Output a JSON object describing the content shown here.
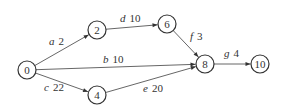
{
  "diagram": {
    "type": "directed-network",
    "nodes": [
      {
        "id": "0",
        "label": "0",
        "x": 27,
        "y": 70
      },
      {
        "id": "2",
        "label": "2",
        "x": 97,
        "y": 30
      },
      {
        "id": "4",
        "label": "4",
        "x": 97,
        "y": 95
      },
      {
        "id": "6",
        "label": "6",
        "x": 167,
        "y": 24
      },
      {
        "id": "8",
        "label": "8",
        "x": 205,
        "y": 64
      },
      {
        "id": "10",
        "label": "10",
        "x": 260,
        "y": 64
      }
    ],
    "edges": [
      {
        "name": "a",
        "weight": "2",
        "from": "0",
        "to": "2",
        "lx": 49,
        "ly": 45
      },
      {
        "name": "b",
        "weight": "10",
        "from": "0",
        "to": "8",
        "lx": 103,
        "ly": 63
      },
      {
        "name": "c",
        "weight": "22",
        "from": "0",
        "to": "4",
        "lx": 44,
        "ly": 91
      },
      {
        "name": "d",
        "weight": "10",
        "from": "2",
        "to": "6",
        "lx": 120,
        "ly": 22
      },
      {
        "name": "e",
        "weight": "20",
        "from": "4",
        "to": "8",
        "lx": 143,
        "ly": 92
      },
      {
        "name": "f",
        "weight": "3",
        "from": "6",
        "to": "8",
        "lx": 190,
        "ly": 40
      },
      {
        "name": "g",
        "weight": "4",
        "from": "8",
        "to": "10",
        "lx": 224,
        "ly": 57
      }
    ]
  }
}
